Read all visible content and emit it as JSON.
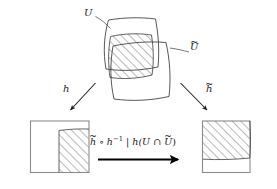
{
  "diagram": {
    "kind": "manifold-chart-transition-diagram",
    "background_color": "#ffffff",
    "ink_color": "#1a1a1a",
    "box_border_color": "#8c8c8c",
    "hatch_color": "#555555",
    "labels": {
      "U": "U",
      "U_tilde_base": "U",
      "tilde": "~",
      "h": "h",
      "h_tilde_base": "h",
      "formula": {
        "h_tilde_base": "h",
        "compose": " ∘ ",
        "h_inverse_base": "h",
        "h_inverse_exponent": "−1",
        "restriction_bar": " | ",
        "image_fn": "h(",
        "set_U": "U",
        "intersection": " ∩ ",
        "set_U_tilde_base": "U",
        "close_paren": ")",
        "plain_text": "h̃ ∘ h⁻¹ | h(U ∩ Ũ)"
      }
    },
    "top_patches": {
      "patch_U_name": "U",
      "patch_U_tilde_name": "U tilde",
      "intersection_hatched": true,
      "hatch_angle_degrees": 45
    },
    "left_chart_box": {
      "name": "image of U under h",
      "hatched_region_position": "bottom-center-right",
      "hatch_angle_degrees": 45
    },
    "right_chart_box": {
      "name": "image of U tilde under h tilde",
      "hatched_region_position": "top-left",
      "hatch_angle_degrees": 45
    },
    "arrows": {
      "left_arrow_label": "h",
      "right_arrow_label": "h tilde",
      "bottom_arrow_direction": "right",
      "bottom_arrow_label": "transition map"
    }
  }
}
